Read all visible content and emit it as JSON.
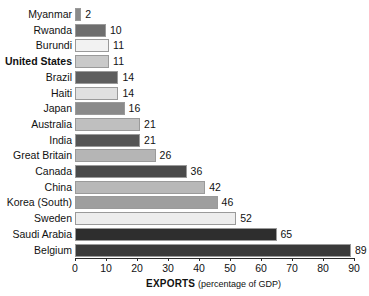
{
  "chart_data": {
    "type": "bar",
    "orientation": "horizontal",
    "title": "",
    "xlabel": "EXPORTS (percentage of GDP)",
    "xlabel_strong": "EXPORTS",
    "xlabel_sub": "(percentage of GDP)",
    "ylabel": "",
    "xlim": [
      0,
      90
    ],
    "xticks": [
      0,
      10,
      20,
      30,
      40,
      50,
      60,
      70,
      80,
      90
    ],
    "xtick_labels": [
      "0",
      "10",
      "20",
      "30",
      "40",
      "50",
      "60",
      "70",
      "80",
      "90"
    ],
    "grid": false,
    "legend": "none",
    "categories": [
      "Myanmar",
      "Rwanda",
      "Burundi",
      "United States",
      "Brazil",
      "Haiti",
      "Japan",
      "Australia",
      "India",
      "Great Britain",
      "Canada",
      "China",
      "Korea (South)",
      "Sweden",
      "Saudi Arabia",
      "Belgium"
    ],
    "values": [
      2,
      10,
      11,
      11,
      14,
      14,
      16,
      21,
      21,
      26,
      36,
      42,
      46,
      52,
      65,
      89
    ],
    "value_labels": [
      "2",
      "10",
      "11",
      "11",
      "14",
      "14",
      "16",
      "21",
      "21",
      "26",
      "36",
      "42",
      "46",
      "52",
      "65",
      "89"
    ],
    "bar_colors": [
      "#8a8a8a",
      "#6e6e6e",
      "#f2f2f2",
      "#c9c9c9",
      "#5e5e5e",
      "#e0e0e0",
      "#8a8a8a",
      "#bfbfbf",
      "#555555",
      "#b5b5b5",
      "#4a4a4a",
      "#b8b8b8",
      "#9e9e9e",
      "#ededed",
      "#2e2e2e",
      "#3a3a3a"
    ],
    "highlighted_category": "United States"
  }
}
